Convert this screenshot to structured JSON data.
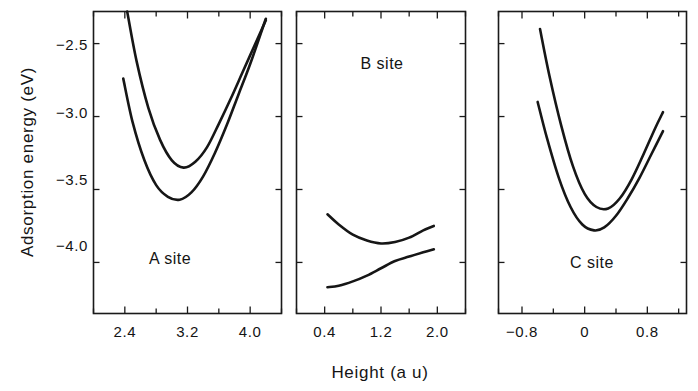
{
  "figure": {
    "background_color": "#ffffff",
    "line_color": "#161616",
    "axis_color": "#1a1a1a",
    "y_axis_title": "Adsorption energy (eV)",
    "x_axis_title": "Height (a u)"
  },
  "chart_data": {
    "type": "line",
    "title": "",
    "xlabel": "Height (a u)",
    "ylabel": "Adsorption energy (eV)",
    "grid": false,
    "legend": "none",
    "shared_ylim": [
      -4.35,
      -2.28
    ],
    "y_ticks": [
      -2.5,
      -3.0,
      -3.5,
      -4.0
    ],
    "y_tick_labels": [
      "−2.5",
      "−3.0",
      "−3.5",
      "−4.0"
    ],
    "panels": [
      {
        "name": "A site",
        "label": "A site",
        "xlim": [
          2.0,
          4.4
        ],
        "x_ticks": [
          2.4,
          3.2,
          4.0
        ],
        "x_tick_labels": [
          "2.4",
          "3.2",
          "4.0"
        ],
        "x_minor_ticks": [
          2.0,
          2.8,
          3.6,
          4.4
        ],
        "series": [
          {
            "name": "upper",
            "x": [
              2.43,
              2.55,
              2.7,
              2.85,
              3.0,
              3.15,
              3.3,
              3.45,
              3.6,
              3.75,
              3.9,
              4.05,
              4.2
            ],
            "y": [
              -2.28,
              -2.62,
              -2.94,
              -3.16,
              -3.3,
              -3.35,
              -3.31,
              -3.21,
              -3.05,
              -2.88,
              -2.7,
              -2.52,
              -2.34
            ]
          },
          {
            "name": "lower",
            "x": [
              2.38,
              2.5,
              2.65,
              2.8,
              2.95,
              3.1,
              3.25,
              3.4,
              3.55,
              3.7,
              3.85,
              4.0,
              4.2
            ],
            "y": [
              -2.74,
              -3.04,
              -3.3,
              -3.47,
              -3.55,
              -3.57,
              -3.52,
              -3.41,
              -3.25,
              -3.06,
              -2.85,
              -2.64,
              -2.33
            ]
          }
        ]
      },
      {
        "name": "B site",
        "label": "B site",
        "xlim": [
          0.0,
          2.4
        ],
        "x_ticks": [
          0.4,
          1.2,
          2.0
        ],
        "x_tick_labels": [
          "0.4",
          "1.2",
          "2.0"
        ],
        "x_minor_ticks": [
          0.0,
          0.8,
          1.6,
          2.4
        ],
        "series": [
          {
            "name": "upper",
            "x": [
              0.44,
              0.6,
              0.8,
              1.0,
              1.2,
              1.4,
              1.6,
              1.8,
              1.95
            ],
            "y": [
              -3.67,
              -3.74,
              -3.81,
              -3.85,
              -3.87,
              -3.86,
              -3.83,
              -3.78,
              -3.75
            ]
          },
          {
            "name": "lower",
            "x": [
              0.44,
              0.6,
              0.8,
              1.0,
              1.2,
              1.4,
              1.6,
              1.8,
              1.95
            ],
            "y": [
              -4.17,
              -4.16,
              -4.13,
              -4.09,
              -4.04,
              -3.99,
              -3.96,
              -3.93,
              -3.91
            ]
          }
        ]
      },
      {
        "name": "C site",
        "label": "C site",
        "xlim": [
          -1.1,
          1.3
        ],
        "x_ticks": [
          -0.8,
          0.0,
          0.8
        ],
        "x_tick_labels": [
          "−0.8",
          "0",
          "0.8"
        ],
        "x_minor_ticks": [
          -1.1,
          -0.4,
          0.4,
          1.2
        ],
        "series": [
          {
            "name": "upper",
            "x": [
              -0.57,
              -0.45,
              -0.3,
              -0.15,
              0.0,
              0.15,
              0.3,
              0.45,
              0.6,
              0.75,
              0.9,
              1.0
            ],
            "y": [
              -2.4,
              -2.72,
              -3.06,
              -3.34,
              -3.53,
              -3.62,
              -3.63,
              -3.56,
              -3.43,
              -3.26,
              -3.08,
              -2.97
            ]
          },
          {
            "name": "lower",
            "x": [
              -0.6,
              -0.48,
              -0.33,
              -0.18,
              -0.03,
              0.12,
              0.25,
              0.4,
              0.55,
              0.7,
              0.85,
              1.0
            ],
            "y": [
              -2.9,
              -3.15,
              -3.42,
              -3.62,
              -3.74,
              -3.78,
              -3.76,
              -3.68,
              -3.56,
              -3.42,
              -3.26,
              -3.1
            ]
          }
        ]
      }
    ]
  }
}
